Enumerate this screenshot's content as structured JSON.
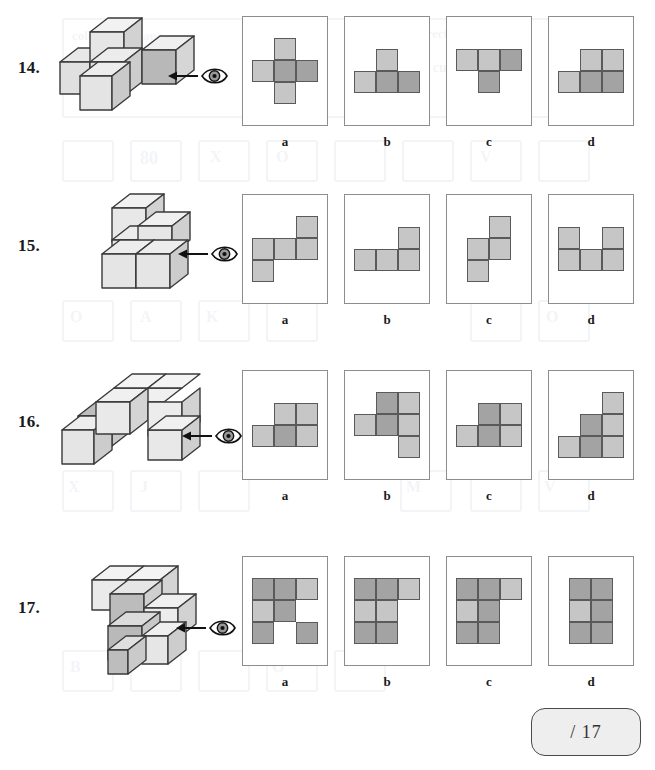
{
  "page": {
    "score_box_label": "/ 17"
  },
  "icons": {
    "eye": "eye-icon",
    "arrow": "arrow-left-icon"
  },
  "colors": {
    "cell_light": "#c6c6c6",
    "cell_dark": "#a3a3a3",
    "cell_border": "#5a5a5a",
    "frame_border": "#8d8d8d",
    "page_background": "#ffffff",
    "score_background": "#eeeeee"
  },
  "option_labels": [
    "a",
    "b",
    "c",
    "d"
  ],
  "questions": [
    {
      "number": "14.",
      "stack_name": "block-stack-14",
      "options": [
        {
          "label": "a",
          "name": "option-14-a",
          "grid": [
            [
              "",
              "light",
              ""
            ],
            [
              "light",
              "dark",
              "dark"
            ],
            [
              "",
              "light",
              ""
            ]
          ]
        },
        {
          "label": "b",
          "name": "option-14-b",
          "grid": [
            [
              "",
              "light",
              ""
            ],
            [
              "light",
              "dark",
              "dark"
            ],
            [
              "",
              "",
              ""
            ]
          ]
        },
        {
          "label": "c",
          "name": "option-14-c",
          "grid": [
            [
              "light",
              "light",
              "dark"
            ],
            [
              "",
              "dark",
              ""
            ],
            [
              "",
              "",
              ""
            ]
          ]
        },
        {
          "label": "d",
          "name": "option-14-d",
          "grid": [
            [
              "",
              "light",
              "light"
            ],
            [
              "light",
              "dark",
              "dark"
            ],
            [
              "",
              "",
              ""
            ]
          ]
        }
      ]
    },
    {
      "number": "15.",
      "stack_name": "block-stack-15",
      "options": [
        {
          "label": "a",
          "name": "option-15-a",
          "grid": [
            [
              "",
              "",
              "light"
            ],
            [
              "light",
              "light",
              "light"
            ],
            [
              "light",
              "",
              ""
            ]
          ]
        },
        {
          "label": "b",
          "name": "option-15-b",
          "grid": [
            [
              "",
              "",
              "light"
            ],
            [
              "light",
              "light",
              "light"
            ],
            [
              "",
              "",
              ""
            ]
          ]
        },
        {
          "label": "c",
          "name": "option-15-c",
          "grid": [
            [
              "",
              "",
              "light"
            ],
            [
              "",
              "light",
              "light"
            ],
            [
              "",
              "light",
              ""
            ]
          ]
        },
        {
          "label": "d",
          "name": "option-15-d",
          "grid": [
            [
              "light",
              "",
              "light"
            ],
            [
              "light",
              "light",
              "light"
            ],
            [
              "",
              "",
              ""
            ]
          ]
        }
      ]
    },
    {
      "number": "16.",
      "stack_name": "block-stack-16",
      "options": [
        {
          "label": "a",
          "name": "option-16-a",
          "grid": [
            [
              "",
              "light",
              "light"
            ],
            [
              "light",
              "dark",
              "light"
            ],
            [
              "",
              "",
              ""
            ]
          ]
        },
        {
          "label": "b",
          "name": "option-16-b",
          "grid": [
            [
              "",
              "dark",
              "light"
            ],
            [
              "light",
              "dark",
              "light"
            ],
            [
              "",
              "",
              "light"
            ]
          ]
        },
        {
          "label": "c",
          "name": "option-16-c",
          "grid": [
            [
              "",
              "dark",
              "light"
            ],
            [
              "light",
              "dark",
              "light"
            ],
            [
              "",
              "",
              ""
            ]
          ]
        },
        {
          "label": "d",
          "name": "option-16-d",
          "grid": [
            [
              "",
              "",
              "light"
            ],
            [
              "",
              "dark",
              "light"
            ],
            [
              "light",
              "dark",
              "light"
            ]
          ]
        }
      ]
    },
    {
      "number": "17.",
      "stack_name": "block-stack-17",
      "options": [
        {
          "label": "a",
          "name": "option-17-a",
          "grid": [
            [
              "dark",
              "dark",
              "light"
            ],
            [
              "light",
              "dark",
              ""
            ],
            [
              "dark",
              "",
              "dark"
            ]
          ]
        },
        {
          "label": "b",
          "name": "option-17-b",
          "grid": [
            [
              "dark",
              "dark",
              "light"
            ],
            [
              "light",
              "light",
              ""
            ],
            [
              "dark",
              "dark",
              ""
            ]
          ]
        },
        {
          "label": "c",
          "name": "option-17-c",
          "grid": [
            [
              "dark",
              "dark",
              "light"
            ],
            [
              "light",
              "dark",
              ""
            ],
            [
              "dark",
              "dark",
              ""
            ]
          ]
        },
        {
          "label": "d",
          "name": "option-17-d",
          "grid": [
            [
              "dark",
              "dark",
              ""
            ],
            [
              "light",
              "dark",
              ""
            ],
            [
              "dark",
              "dark",
              ""
            ]
          ]
        }
      ]
    }
  ]
}
